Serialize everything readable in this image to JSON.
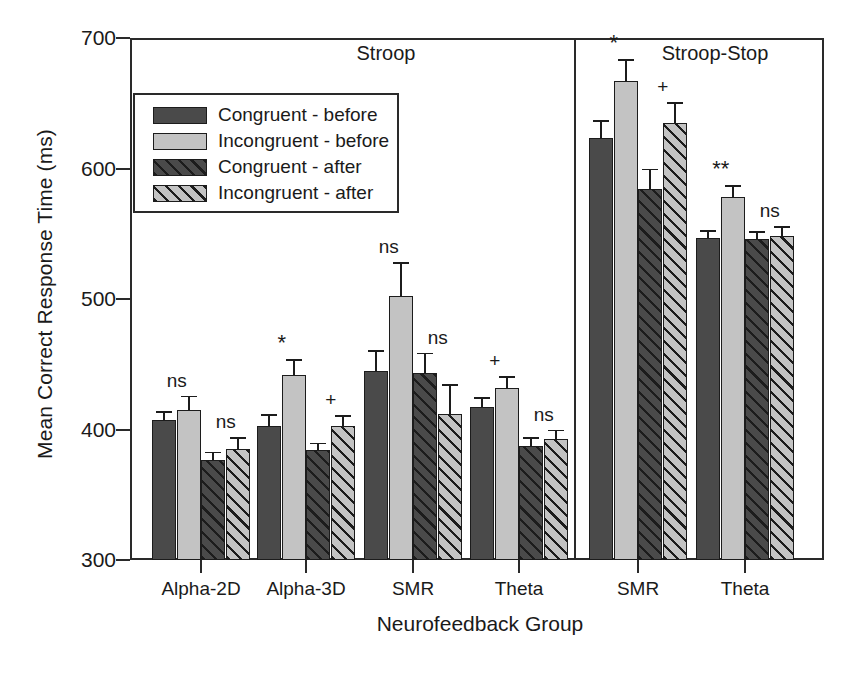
{
  "chart_data": {
    "type": "bar",
    "title": "",
    "xlabel": "Neurofeedback Group",
    "ylabel": "Mean Correct Response Time (ms)",
    "ylim": [
      300,
      700
    ],
    "yticks": [
      300,
      400,
      500,
      600,
      700
    ],
    "grid": false,
    "legend_position": "upper-left-inside",
    "panels": [
      {
        "label": "Stroop",
        "groups": [
          "Alpha-2D",
          "Alpha-3D",
          "SMR",
          "Theta"
        ]
      },
      {
        "label": "Stroop-Stop",
        "groups": [
          "SMR",
          "Theta"
        ]
      }
    ],
    "categories": [
      "Alpha-2D",
      "Alpha-3D",
      "SMR",
      "Theta",
      "SMR",
      "Theta"
    ],
    "series": [
      {
        "name": "Congruent - before",
        "values": [
          407,
          403,
          445,
          417,
          623,
          547
        ],
        "errors": [
          7,
          9,
          16,
          8,
          14,
          6
        ]
      },
      {
        "name": "Incongruent - before",
        "values": [
          415,
          442,
          502,
          432,
          667,
          578
        ],
        "errors": [
          11,
          12,
          26,
          9,
          17,
          9
        ]
      },
      {
        "name": "Congruent - after",
        "values": [
          377,
          384,
          443,
          387,
          584,
          546
        ],
        "errors": [
          6,
          6,
          16,
          7,
          16,
          6
        ]
      },
      {
        "name": "Incongruent - after",
        "values": [
          385,
          403,
          412,
          393,
          635,
          548
        ],
        "errors": [
          9,
          8,
          23,
          7,
          16,
          8
        ]
      }
    ],
    "annotations": [
      {
        "text": "ns",
        "group": 0,
        "pair": "before"
      },
      {
        "text": "ns",
        "group": 0,
        "pair": "after"
      },
      {
        "text": "*",
        "group": 1,
        "pair": "before"
      },
      {
        "text": "+",
        "group": 1,
        "pair": "after"
      },
      {
        "text": "ns",
        "group": 2,
        "pair": "before"
      },
      {
        "text": "ns",
        "group": 2,
        "pair": "after"
      },
      {
        "text": "+",
        "group": 3,
        "pair": "before"
      },
      {
        "text": "ns",
        "group": 3,
        "pair": "after"
      },
      {
        "text": "*",
        "group": 4,
        "pair": "before"
      },
      {
        "text": "+",
        "group": 4,
        "pair": "after"
      },
      {
        "text": "**",
        "group": 5,
        "pair": "before"
      },
      {
        "text": "ns",
        "group": 5,
        "pair": "after"
      }
    ]
  },
  "axis": {
    "ylabel": "Mean Correct Response Time (ms)",
    "xlabel": "Neurofeedback Group",
    "ytick_labels": [
      "700",
      "600",
      "500",
      "400",
      "300"
    ],
    "xtick_labels": [
      "Alpha-2D",
      "Alpha-3D",
      "SMR",
      "Theta",
      "SMR",
      "Theta"
    ]
  },
  "panels": {
    "left_title": "Stroop",
    "right_title": "Stroop-Stop"
  },
  "legend": {
    "items": [
      {
        "label": "Congruent - before",
        "pattern": "solid-dark"
      },
      {
        "label": "Incongruent - before",
        "pattern": "solid-light"
      },
      {
        "label": "Congruent - after",
        "pattern": "hatch-dark"
      },
      {
        "label": "Incongruent - after",
        "pattern": "hatch-light"
      }
    ]
  },
  "colors": {
    "dark": "#4a4a4a",
    "light": "#c3c3c3",
    "ink": "#1c1c1c"
  }
}
